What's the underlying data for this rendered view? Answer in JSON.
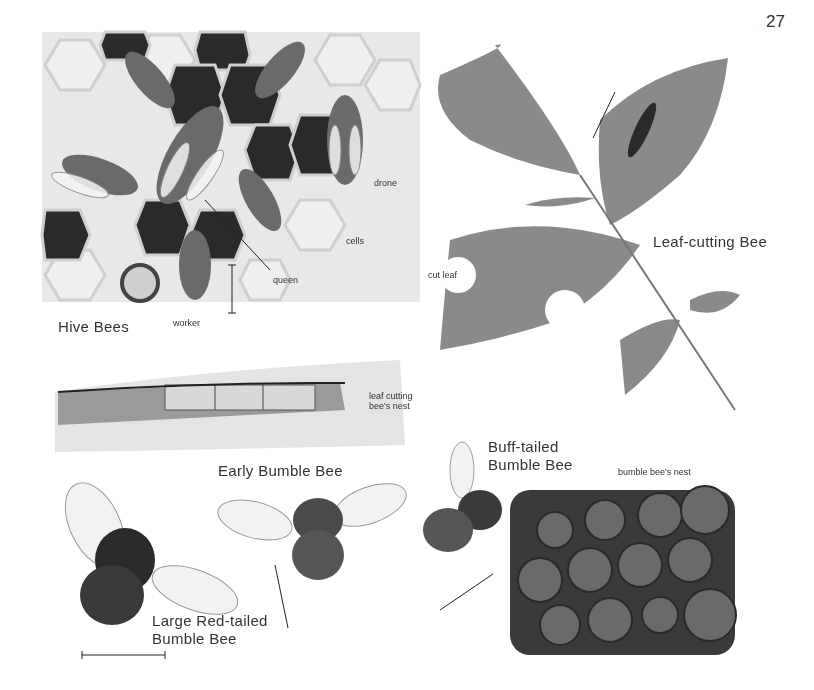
{
  "page": {
    "number": "27"
  },
  "sections": {
    "hive_bees": {
      "title": "Hive Bees",
      "labels": {
        "drone": "drone",
        "cells": "cells",
        "queen": "queen",
        "worker": "worker"
      }
    },
    "leaf_cutting_bee": {
      "title": "Leaf-cutting Bee",
      "labels": {
        "cut_leaf": "cut leaf",
        "nest_line1": "leaf cutting",
        "nest_line2": "bee's nest"
      }
    },
    "early_bumble_bee": {
      "title": "Early Bumble Bee"
    },
    "large_red_tailed": {
      "title_line1": "Large Red-tailed",
      "title_line2": "Bumble Bee"
    },
    "buff_tailed": {
      "title_line1": "Buff-tailed",
      "title_line2": "Bumble Bee",
      "labels": {
        "nest": "bumble bee's nest"
      }
    }
  },
  "colors": {
    "ink": "#222222",
    "dark_cell": "#2a2a2a",
    "light_cell": "#ececec",
    "leaf": "#8a8a8a",
    "nest_ball": "#6a6a6a"
  }
}
